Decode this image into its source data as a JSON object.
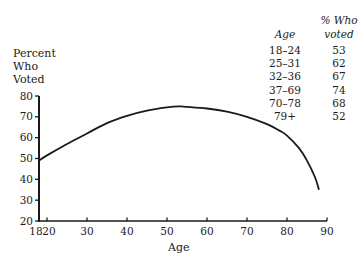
{
  "chart_data": {
    "type": "line",
    "title": "",
    "xlabel": "Age",
    "ylabel": "Percent Who Voted",
    "ylabel_lines": [
      "Percent",
      "Who",
      "Voted"
    ],
    "xlim": [
      18,
      90
    ],
    "ylim": [
      20,
      80
    ],
    "x_ticks": [
      18,
      20,
      30,
      40,
      50,
      60,
      70,
      80,
      90
    ],
    "y_ticks": [
      20,
      30,
      40,
      50,
      60,
      70,
      80
    ],
    "grid": false,
    "legend": "none",
    "series": [
      {
        "name": "Percent who voted",
        "x": [
          18,
          20,
          25,
          30,
          35,
          40,
          45,
          50,
          53,
          55,
          60,
          65,
          70,
          75,
          78,
          80,
          83,
          85,
          87,
          88
        ],
        "y": [
          49,
          51.5,
          57,
          62,
          67,
          70.5,
          73,
          74.5,
          75,
          74.8,
          74,
          72.5,
          70,
          66.5,
          63.5,
          61,
          55,
          49,
          41,
          35
        ]
      }
    ],
    "annotation_table": {
      "headers": [
        "Age",
        "% Who voted"
      ],
      "rows": [
        {
          "age": "18–24",
          "pct": "53"
        },
        {
          "age": "25–31",
          "pct": "62"
        },
        {
          "age": "32–36",
          "pct": "67"
        },
        {
          "age": "37–69",
          "pct": "74"
        },
        {
          "age": "70–78",
          "pct": "68"
        },
        {
          "age": "79+",
          "pct": "52"
        }
      ]
    }
  },
  "labels": {
    "y_line1": "Percent",
    "y_line2": "Who",
    "y_line3": "Voted",
    "x_title": "Age",
    "table_age_header": "Age",
    "table_pct_header_line1": "% Who",
    "table_pct_header_line2": "voted"
  }
}
